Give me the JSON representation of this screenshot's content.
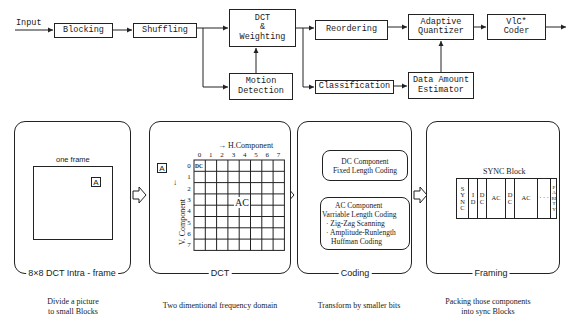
{
  "flow": {
    "input_label": "Input",
    "blocks": {
      "blocking": "Blocking",
      "shuffling": "Shuffling",
      "dct_weighting": "DCT\n&\nWeighting",
      "motion_detection": "Motion\nDetection",
      "reordering": "Reordering",
      "classification": "Classification",
      "adaptive_quantizer": "Adaptive\nQuantizer",
      "data_amount_estimator": "Data Amount\nEstimator",
      "vlc_coder": "VlC*\nCoder"
    }
  },
  "panels": {
    "blocking": {
      "title": "8×8 DCT  Intra - frame",
      "frame_label": "one frame",
      "block_label": "A",
      "caption": "Divide a picture\nto small Blocks"
    },
    "dct": {
      "title": "DCT",
      "h_axis_label": "→ H.Component",
      "v_axis_label": "V. Component",
      "v_arrow": "↓",
      "block_label": "A",
      "col_labels": [
        "0",
        "1",
        "2",
        "3",
        "4",
        "5",
        "6",
        "7"
      ],
      "row_labels": [
        "0",
        "1",
        "2",
        "3",
        "4",
        "5",
        "6",
        "7"
      ],
      "dc_label": "DC",
      "ac_label": "AC",
      "caption": "Two dimentional frequency domain"
    },
    "coding": {
      "title": "Coding",
      "dc_box": {
        "line1": "DC Component",
        "line2": "Fixed Length Coding"
      },
      "ac_box": {
        "line1": "AC Component",
        "line2": "Varriable Length Coding",
        "bullet1": "· Zig-Zag  Scanning",
        "bullet2": "· Amplitude-Runlength",
        "bullet2_cont": "Huffman  Coding"
      },
      "caption": "Transform by smaller bits"
    },
    "framing": {
      "title": "Framing",
      "sync_block_label": "SYNC  Block",
      "segments": [
        "S\nY\nN\nC",
        "I\nD",
        "D\nC",
        "AC",
        "D\nC",
        "AC",
        "· · ·",
        "P\nA\nRI\nT\nY"
      ],
      "caption": "Packing those components\ninto sync Blocks"
    }
  },
  "colors": {
    "line": "#222222",
    "background": "#ffffff"
  }
}
